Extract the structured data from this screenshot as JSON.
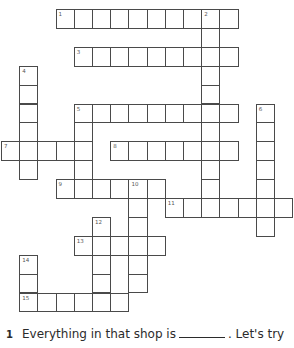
{
  "puzzle": {
    "grid": {
      "origin_x": 1,
      "origin_y": 9,
      "cell_w": 18.2,
      "cell_h": 18.9,
      "border_color": "#4a4a4a"
    },
    "entries": [
      {
        "number": "1",
        "direction": "across",
        "col": 3,
        "row": 0,
        "length": 10
      },
      {
        "number": "2",
        "direction": "down",
        "col": 11,
        "row": 0,
        "length": 11
      },
      {
        "number": "3",
        "direction": "across",
        "col": 4,
        "row": 2,
        "length": 9
      },
      {
        "number": "4",
        "direction": "down",
        "col": 1,
        "row": 3,
        "length": 6
      },
      {
        "number": "5",
        "direction": "across",
        "col": 4,
        "row": 5,
        "length": 9
      },
      {
        "number": "5",
        "direction": "down",
        "col": 4,
        "row": 5,
        "length": 5
      },
      {
        "number": "6",
        "direction": "down",
        "col": 14,
        "row": 5,
        "length": 7
      },
      {
        "number": "7",
        "direction": "across",
        "col": 0,
        "row": 7,
        "length": 5
      },
      {
        "number": "8",
        "direction": "across",
        "col": 6,
        "row": 7,
        "length": 7
      },
      {
        "number": "9",
        "direction": "across",
        "col": 3,
        "row": 9,
        "length": 6
      },
      {
        "number": "10",
        "direction": "down",
        "col": 7,
        "row": 9,
        "length": 6
      },
      {
        "number": "11",
        "direction": "across",
        "col": 9,
        "row": 10,
        "length": 7
      },
      {
        "number": "12",
        "direction": "down",
        "col": 5,
        "row": 11,
        "length": 5
      },
      {
        "number": "13",
        "direction": "across",
        "col": 4,
        "row": 12,
        "length": 5
      },
      {
        "number": "14",
        "direction": "down",
        "col": 1,
        "row": 13,
        "length": 3
      },
      {
        "number": "15",
        "direction": "across",
        "col": 1,
        "row": 15,
        "length": 6
      }
    ]
  },
  "clues": {
    "first": {
      "number": "1",
      "text_before": "Everything in that shop is",
      "text_after": ". Let's try"
    }
  }
}
